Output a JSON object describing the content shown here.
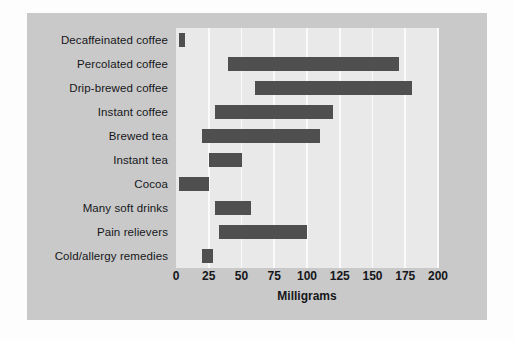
{
  "chart_data": {
    "type": "bar",
    "bar_style": "range",
    "orientation": "horizontal",
    "title": "",
    "xlabel": "Milligrams",
    "ylabel": "",
    "xlim": [
      0,
      200
    ],
    "xticks": [
      0,
      25,
      50,
      75,
      100,
      125,
      150,
      175,
      200
    ],
    "xtick_labels": [
      "0",
      "25",
      "50",
      "75",
      "100",
      "125",
      "150",
      "175",
      "200"
    ],
    "grid": true,
    "grid_axis": "x",
    "legend": false,
    "categories": [
      "Decaffeinated coffee",
      "Percolated coffee",
      "Drip-brewed coffee",
      "Instant coffee",
      "Brewed tea",
      "Instant tea",
      "Cocoa",
      "Many soft drinks",
      "Pain relievers",
      "Cold/allergy remedies"
    ],
    "ranges": [
      {
        "category": "Decaffeinated coffee",
        "low": 2,
        "high": 7
      },
      {
        "category": "Percolated coffee",
        "low": 40,
        "high": 170
      },
      {
        "category": "Drip-brewed coffee",
        "low": 60,
        "high": 180
      },
      {
        "category": "Instant coffee",
        "low": 30,
        "high": 120
      },
      {
        "category": "Brewed tea",
        "low": 20,
        "high": 110
      },
      {
        "category": "Instant tea",
        "low": 25,
        "high": 50
      },
      {
        "category": "Cocoa",
        "low": 2,
        "high": 25
      },
      {
        "category": "Many soft drinks",
        "low": 30,
        "high": 57
      },
      {
        "category": "Pain relievers",
        "low": 33,
        "high": 100
      },
      {
        "category": "Cold/allergy remedies",
        "low": 20,
        "high": 28
      }
    ],
    "colors": {
      "bar": "#4f4f4f",
      "plot_background": "#e9e9e9",
      "panel_background": "#c9c9c9",
      "gridline": "#fafafa",
      "text": "#16171a"
    }
  }
}
